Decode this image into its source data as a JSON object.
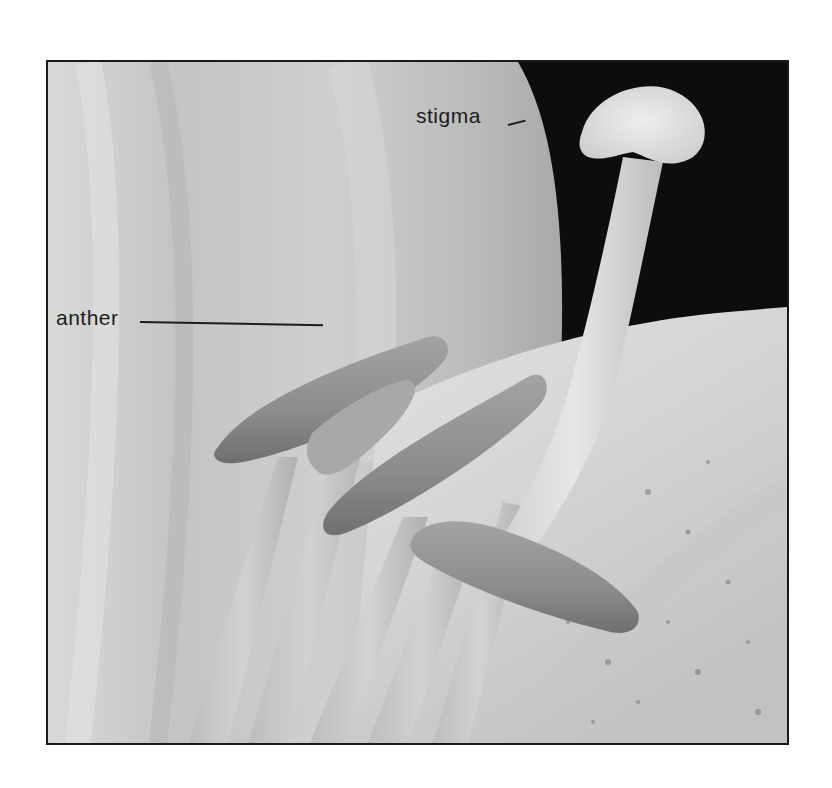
{
  "figure": {
    "labels": [
      {
        "id": "stigma",
        "text": "stigma"
      },
      {
        "id": "anther",
        "text": "anther"
      }
    ],
    "colors": {
      "frame_border": "#1a1a1a",
      "background_dark": "#0d0d0d",
      "petal_light": "#d8d8d8",
      "petal_mid": "#bdbdbd",
      "anther": "#8e8e8e",
      "label_text": "#1c1c1c"
    }
  }
}
